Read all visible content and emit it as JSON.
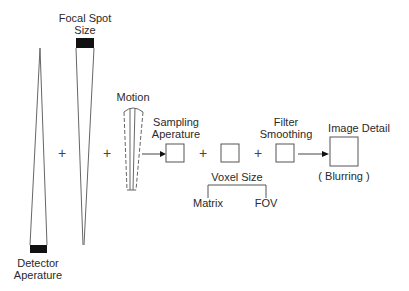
{
  "diagram": {
    "labels": {
      "focal_spot_line1": "Focal Spot",
      "focal_spot_line2": "Size",
      "detector_line1": "Detector",
      "detector_line2": "Aperature",
      "motion": "Motion",
      "sampling_line1": "Sampling",
      "sampling_line2": "Aperature",
      "filter_line1": "Filter",
      "filter_line2": "Smoothing",
      "image_detail": "Image Detail",
      "blurring": "( Blurring )",
      "voxel_size": "Voxel Size",
      "matrix": "Matrix",
      "fov": "FOV"
    },
    "operators": {
      "plus1": "+",
      "plus2": "+",
      "plus3": "+",
      "plus4": "+"
    },
    "colors": {
      "line": "#555555",
      "fill": "#111111",
      "text": "#2a2a2a"
    }
  }
}
